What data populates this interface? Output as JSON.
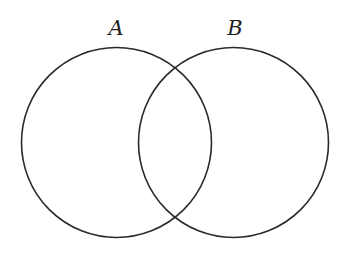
{
  "diagram": {
    "type": "venn",
    "sets": [
      {
        "name": "A",
        "label": "A",
        "cx": 116.5,
        "cy": 142.5,
        "r": 95
      },
      {
        "name": "B",
        "label": "B",
        "cx": 233.5,
        "cy": 142.5,
        "r": 95
      }
    ],
    "stroke_color": "#2a2a2a",
    "background": "#ffffff"
  }
}
